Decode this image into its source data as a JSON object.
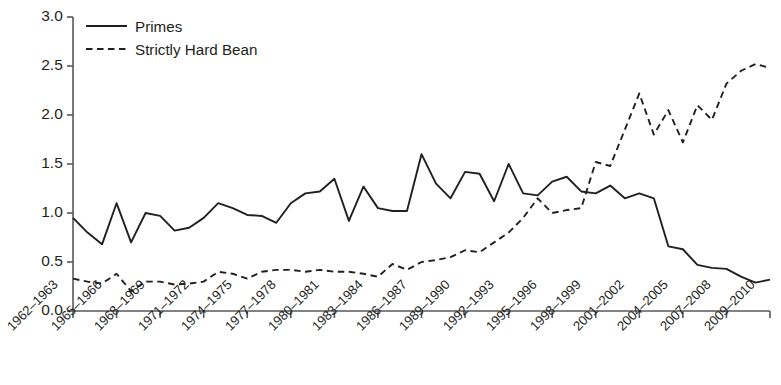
{
  "chart_data": {
    "type": "line",
    "title": "",
    "subtitle": "",
    "xlabel": "",
    "ylabel": "",
    "xlim": [
      1962,
      2010
    ],
    "ylim": [
      0.0,
      3.0
    ],
    "grid": false,
    "legend_position": "top-left",
    "ytick_labels": [
      "3.0",
      "2.5",
      "2.0",
      "1.5",
      "1.0",
      "0.5",
      "0.0"
    ],
    "ytick_values": [
      3.0,
      2.5,
      2.0,
      1.5,
      1.0,
      0.5,
      0.0
    ],
    "xtick_labels": [
      "1962–1963",
      "1965–1966",
      "1968–1969",
      "1971–1972",
      "1974–1975",
      "1977–1978",
      "1980–1981",
      "1983–1984",
      "1986–1987",
      "1989–1990",
      "1992–1993",
      "1995–1996",
      "1998–1999",
      "2001–2002",
      "2004–2005",
      "2007–2008",
      "2009–2010"
    ],
    "xtick_values": [
      1962,
      1965,
      1968,
      1971,
      1974,
      1977,
      1980,
      1983,
      1986,
      1989,
      1992,
      1995,
      1998,
      2001,
      2004,
      2007,
      2010
    ],
    "x": [
      1962,
      1963,
      1964,
      1965,
      1966,
      1967,
      1968,
      1969,
      1970,
      1971,
      1972,
      1973,
      1974,
      1975,
      1976,
      1977,
      1978,
      1979,
      1980,
      1981,
      1982,
      1983,
      1984,
      1985,
      1986,
      1987,
      1988,
      1989,
      1990,
      1991,
      1992,
      1993,
      1994,
      1995,
      1996,
      1997,
      1998,
      1999,
      2000,
      2001,
      2002,
      2003,
      2004,
      2005,
      2006,
      2007,
      2008,
      2009,
      2010
    ],
    "series": [
      {
        "name": "Primes",
        "style": "solid",
        "color": "#231f20",
        "values": [
          0.95,
          0.8,
          0.68,
          1.1,
          0.7,
          1.0,
          0.97,
          0.82,
          0.85,
          0.95,
          1.1,
          1.05,
          0.98,
          0.97,
          0.9,
          1.1,
          1.2,
          1.22,
          1.35,
          0.92,
          1.27,
          1.05,
          1.02,
          1.02,
          1.6,
          1.3,
          1.15,
          1.42,
          1.4,
          1.12,
          1.5,
          1.2,
          1.18,
          1.32,
          1.37,
          1.22,
          1.2,
          1.28,
          1.15,
          1.2,
          1.15,
          0.66,
          0.63,
          0.47,
          0.44,
          0.43,
          0.35,
          0.29,
          0.32
        ]
      },
      {
        "name": "Strictly Hard Bean",
        "style": "dashed",
        "color": "#231f20",
        "values": [
          0.33,
          0.3,
          0.28,
          0.38,
          0.2,
          0.3,
          0.3,
          0.27,
          0.28,
          0.3,
          0.4,
          0.38,
          0.33,
          0.4,
          0.42,
          0.42,
          0.4,
          0.42,
          0.4,
          0.4,
          0.38,
          0.35,
          0.48,
          0.42,
          0.5,
          0.52,
          0.55,
          0.62,
          0.6,
          0.7,
          0.8,
          0.95,
          1.15,
          1.0,
          1.03,
          1.05,
          1.52,
          1.48,
          1.85,
          2.22,
          1.8,
          2.05,
          1.72,
          2.1,
          1.95,
          2.32,
          2.45,
          2.52,
          2.48
        ]
      }
    ]
  },
  "legend": {
    "items": [
      {
        "label": "Primes",
        "style": "solid"
      },
      {
        "label": "Strictly Hard Bean",
        "style": "dashed"
      }
    ]
  }
}
